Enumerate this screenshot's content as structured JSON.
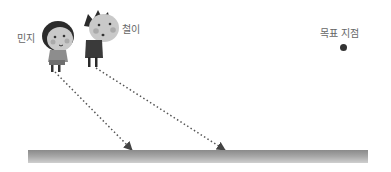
{
  "labels": {
    "minji": "민지",
    "cheolyi": "철이",
    "goal": "목표 지점"
  },
  "colors": {
    "ground": "#a0a0a0",
    "arrow": "#555555",
    "goal_dot": "#333333",
    "label_text": "#666666"
  },
  "arrows": [
    {
      "from": "minji",
      "start": [
        55,
        72
      ],
      "end": [
        132,
        150
      ]
    },
    {
      "from": "cheolyi",
      "start": [
        96,
        68
      ],
      "end": [
        225,
        150
      ]
    }
  ]
}
